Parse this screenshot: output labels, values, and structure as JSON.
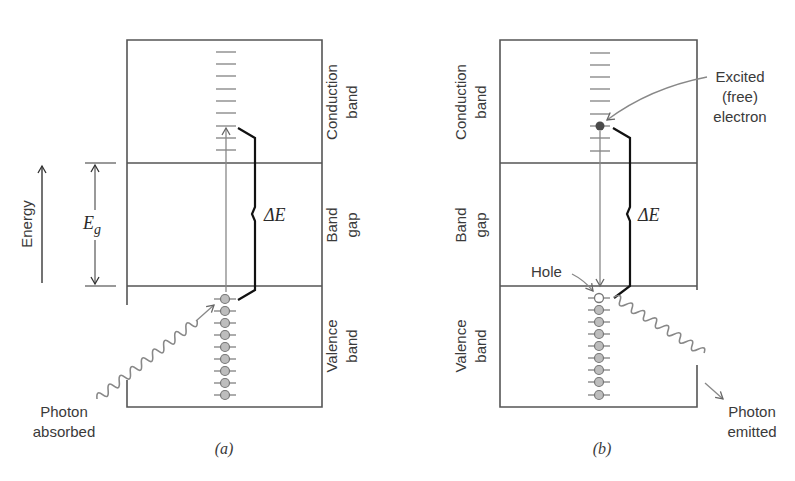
{
  "figure": {
    "panels": [
      {
        "id": "a",
        "caption": "(a)",
        "band_labels": {
          "conduction": [
            "Conduction",
            "band"
          ],
          "gap": [
            "Band",
            "gap"
          ],
          "valence": [
            "Valence",
            "band"
          ]
        },
        "delta_label": "ΔE",
        "photon_label": [
          "Photon",
          "absorbed"
        ],
        "conduction_levels": 9,
        "valence_atoms": 9,
        "transition": "upward"
      },
      {
        "id": "b",
        "caption": "(b)",
        "band_labels": {
          "conduction": [
            "Conduction",
            "band"
          ],
          "gap": [
            "Band",
            "gap"
          ],
          "valence": [
            "Valence",
            "band"
          ]
        },
        "delta_label": "ΔE",
        "photon_label": [
          "Photon",
          "emitted"
        ],
        "electron_label": [
          "Excited",
          "(free)",
          "electron"
        ],
        "hole_label": "Hole",
        "conduction_levels": 9,
        "valence_atoms": 9,
        "transition": "downward"
      }
    ],
    "energy_axis": {
      "label": "Energy",
      "gap_symbol": "E",
      "gap_subscript": "g"
    }
  }
}
